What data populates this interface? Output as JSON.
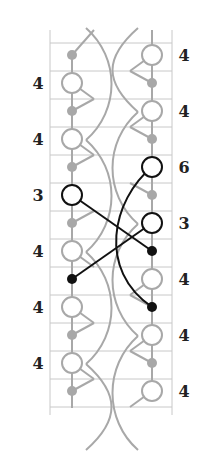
{
  "diagram": {
    "type": "chain-diagram",
    "colors": {
      "grid": "#c8c8c8",
      "inactive": "#a8a8a8",
      "active": "#111111",
      "background": "#ffffff"
    },
    "frame": {
      "left": 50,
      "right": 172,
      "top": 30,
      "bottom": 415
    },
    "grid_lines_y": [
      43,
      71,
      99,
      127,
      155,
      183,
      211,
      239,
      267,
      295,
      323,
      351,
      379,
      407
    ],
    "columns": {
      "left_x": 72,
      "right_x": 152
    },
    "left_labels": [
      {
        "y": 83,
        "text": "4"
      },
      {
        "y": 139,
        "text": "4"
      },
      {
        "y": 195,
        "text": "3"
      },
      {
        "y": 251,
        "text": "4"
      },
      {
        "y": 307,
        "text": "4"
      },
      {
        "y": 363,
        "text": "4"
      }
    ],
    "right_labels": [
      {
        "y": 55,
        "text": "4"
      },
      {
        "y": 111,
        "text": "4"
      },
      {
        "y": 167,
        "text": "6"
      },
      {
        "y": 223,
        "text": "3"
      },
      {
        "y": 279,
        "text": "4"
      },
      {
        "y": 335,
        "text": "4"
      },
      {
        "y": 391,
        "text": "4"
      }
    ],
    "left_nodes": [
      {
        "y": 55,
        "kind": "dot",
        "active": false
      },
      {
        "y": 83,
        "kind": "ring",
        "active": false
      },
      {
        "y": 111,
        "kind": "dot",
        "active": false
      },
      {
        "y": 139,
        "kind": "ring",
        "active": false
      },
      {
        "y": 167,
        "kind": "dot",
        "active": false
      },
      {
        "y": 195,
        "kind": "ring",
        "active": true
      },
      {
        "y": 223,
        "kind": "dot",
        "active": false
      },
      {
        "y": 251,
        "kind": "ring",
        "active": false
      },
      {
        "y": 279,
        "kind": "dot",
        "active": true
      },
      {
        "y": 307,
        "kind": "ring",
        "active": false
      },
      {
        "y": 335,
        "kind": "dot",
        "active": false
      },
      {
        "y": 363,
        "kind": "ring",
        "active": false
      },
      {
        "y": 391,
        "kind": "dot",
        "active": false
      }
    ],
    "right_nodes": [
      {
        "y": 55,
        "kind": "ring",
        "active": false
      },
      {
        "y": 83,
        "kind": "dot",
        "active": false
      },
      {
        "y": 111,
        "kind": "ring",
        "active": false
      },
      {
        "y": 139,
        "kind": "dot",
        "active": false
      },
      {
        "y": 167,
        "kind": "ring",
        "active": true
      },
      {
        "y": 195,
        "kind": "dot",
        "active": false
      },
      {
        "y": 223,
        "kind": "ring",
        "active": true
      },
      {
        "y": 251,
        "kind": "dot",
        "active": true
      },
      {
        "y": 279,
        "kind": "ring",
        "active": false
      },
      {
        "y": 307,
        "kind": "dot",
        "active": true
      },
      {
        "y": 335,
        "kind": "ring",
        "active": false
      },
      {
        "y": 363,
        "kind": "dot",
        "active": false
      },
      {
        "y": 391,
        "kind": "ring",
        "active": false
      }
    ]
  }
}
